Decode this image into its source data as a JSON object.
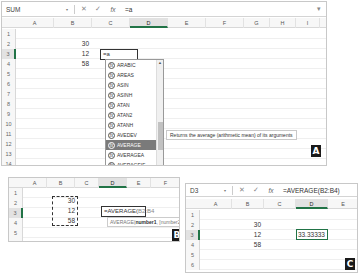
{
  "panel_a": {
    "name_box": "SUM",
    "formula_value": "=a",
    "columns": [
      "A",
      "B",
      "C",
      "D",
      "E",
      "F",
      "G",
      "H",
      "I"
    ],
    "rows": [
      "1",
      "2",
      "3",
      "4",
      "5",
      "6",
      "7",
      "8",
      "9",
      "10",
      "11",
      "12",
      "13",
      "14"
    ],
    "cells": {
      "B2": "30",
      "B3": "12",
      "B4": "58",
      "D3": "=a"
    },
    "dropdown_items": [
      "ARABIC",
      "AREAS",
      "ASIN",
      "ASINH",
      "ATAN",
      "ATAN2",
      "ATANH",
      "AVEDEV",
      "AVERAGE",
      "AVERAGEA",
      "AVERAGEIF",
      "AVERAGEIFS"
    ],
    "selected_item": "AVERAGE",
    "tooltip": "Returns the average (arithmetic mean) of its arguments",
    "badge": "A"
  },
  "panel_b": {
    "columns": [
      "A",
      "B",
      "C",
      "D",
      "E",
      "F"
    ],
    "rows": [
      "1",
      "2",
      "3",
      "4",
      "5",
      "6"
    ],
    "cells": {
      "B2": "30",
      "B3": "12",
      "B4": "58"
    },
    "edit_prefix": "=AVERAGE(",
    "edit_ref": "B2:B4",
    "hint_fn": "AVERAGE(",
    "hint_arg1": "number1",
    "hint_rest": ", [number2], ...)",
    "badge": "B"
  },
  "panel_c": {
    "name_box": "D3",
    "formula_value": "=AVERAGE(B2:B4)",
    "columns": [
      "A",
      "B",
      "C",
      "D",
      "E"
    ],
    "rows": [
      "1",
      "2",
      "3",
      "4",
      "5",
      "6"
    ],
    "cells": {
      "B2": "30",
      "B3": "12",
      "B4": "58",
      "D3": "33.33333"
    },
    "badge": "C"
  },
  "icons": {
    "cancel": "✕",
    "enter": "✓",
    "fx": "fx",
    "dropdown": "▾"
  }
}
